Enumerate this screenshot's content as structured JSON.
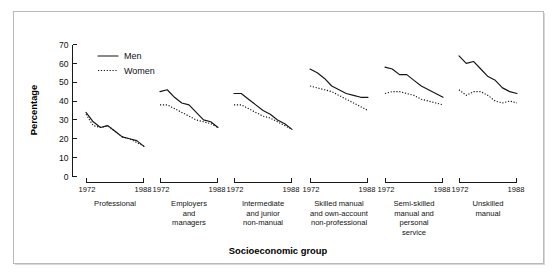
{
  "figure": {
    "background_color": "#ffffff",
    "border_color": "#b9b9b9",
    "line_color": "#141414"
  },
  "axis_titles": {
    "y": "Percentage",
    "x": "Socioeconomic group"
  },
  "legend": {
    "position": "top-left",
    "entries": [
      {
        "label": "Men",
        "style": "solid"
      },
      {
        "label": "Women",
        "style": "dotted"
      }
    ]
  },
  "y_axis": {
    "ticks": [
      "0",
      "10",
      "20",
      "30",
      "40",
      "50",
      "60",
      "70"
    ]
  },
  "x_axis": {
    "start_label": "1972",
    "end_label": "1988"
  },
  "panels": [
    {
      "label_lines": [
        "Professional"
      ]
    },
    {
      "label_lines": [
        "Employers",
        "and",
        "managers"
      ]
    },
    {
      "label_lines": [
        "Intermediate",
        "and junior",
        "non-manual"
      ]
    },
    {
      "label_lines": [
        "Skilled manual",
        "and own-account",
        "non-professional"
      ]
    },
    {
      "label_lines": [
        "Semi-skilled",
        "manual and",
        "personal",
        "service"
      ]
    },
    {
      "label_lines": [
        "Unskilled",
        "manual"
      ]
    }
  ],
  "chart_data": {
    "type": "line",
    "title": "",
    "subtitle": "",
    "xlabel": "Socioeconomic group",
    "ylabel": "Percentage",
    "ylim": [
      0,
      70
    ],
    "ytick_step": 10,
    "grid": false,
    "legend_position": "top-left",
    "panel_layout": "small-multiples-1x6",
    "x": [
      1972,
      1974,
      1976,
      1978,
      1980,
      1982,
      1984,
      1986,
      1988
    ],
    "xtick_labels": [
      "1972",
      "1988"
    ],
    "panels": [
      {
        "name": "Professional",
        "series": [
          {
            "name": "Men",
            "style": "solid",
            "values": [
              34,
              29,
              26,
              27,
              24,
              21,
              20,
              19,
              16
            ]
          },
          {
            "name": "Women",
            "style": "dotted",
            "values": [
              33,
              27,
              26,
              27,
              24,
              21,
              20,
              18,
              16
            ]
          }
        ]
      },
      {
        "name": "Employers and managers",
        "series": [
          {
            "name": "Men",
            "style": "solid",
            "values": [
              45,
              46,
              42,
              39,
              38,
              34,
              30,
              29,
              26
            ]
          },
          {
            "name": "Women",
            "style": "dotted",
            "values": [
              38,
              38,
              36,
              34,
              32,
              30,
              29,
              28,
              26
            ]
          }
        ]
      },
      {
        "name": "Intermediate and junior non-manual",
        "series": [
          {
            "name": "Men",
            "style": "solid",
            "values": [
              44,
              44,
              41,
              38,
              35,
              33,
              30,
              28,
              25
            ]
          },
          {
            "name": "Women",
            "style": "dotted",
            "values": [
              38,
              38,
              36,
              34,
              32,
              31,
              29,
              27,
              25
            ]
          }
        ]
      },
      {
        "name": "Skilled manual and own-account non-professional",
        "series": [
          {
            "name": "Men",
            "style": "solid",
            "values": [
              57,
              55,
              52,
              48,
              46,
              44,
              43,
              42,
              42
            ]
          },
          {
            "name": "Women",
            "style": "dotted",
            "values": [
              48,
              47,
              46,
              45,
              43,
              41,
              39,
              37,
              35
            ]
          }
        ]
      },
      {
        "name": "Semi-skilled manual and personal service",
        "series": [
          {
            "name": "Men",
            "style": "solid",
            "values": [
              58,
              57,
              54,
              54,
              51,
              48,
              46,
              44,
              42
            ]
          },
          {
            "name": "Women",
            "style": "dotted",
            "values": [
              44,
              45,
              45,
              44,
              43,
              41,
              40,
              39,
              38
            ]
          }
        ]
      },
      {
        "name": "Unskilled manual",
        "series": [
          {
            "name": "Men",
            "style": "solid",
            "values": [
              64,
              60,
              61,
              57,
              53,
              51,
              47,
              45,
              44
            ]
          },
          {
            "name": "Women",
            "style": "dotted",
            "values": [
              46,
              43,
              45,
              45,
              43,
              40,
              39,
              40,
              39
            ]
          }
        ]
      }
    ]
  }
}
